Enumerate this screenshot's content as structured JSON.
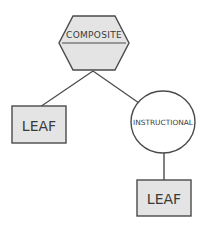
{
  "diagram": {
    "type": "tree",
    "colors": {
      "stroke": "#4a4a4a",
      "fill": "#e4e4e4",
      "circle_fill": "#ffffff",
      "text": "#3a3a3a"
    },
    "nodes": [
      {
        "id": "composite",
        "shape": "hexagon",
        "label": "COMPOSITE"
      },
      {
        "id": "leaf1",
        "shape": "rectangle",
        "label": "LEAF"
      },
      {
        "id": "instructional",
        "shape": "circle",
        "label": "INSTRUCTIONAL"
      },
      {
        "id": "leaf2",
        "shape": "rectangle",
        "label": "LEAF"
      }
    ],
    "edges": [
      {
        "from": "composite",
        "to": "leaf1"
      },
      {
        "from": "composite",
        "to": "instructional"
      },
      {
        "from": "instructional",
        "to": "leaf2"
      }
    ]
  }
}
